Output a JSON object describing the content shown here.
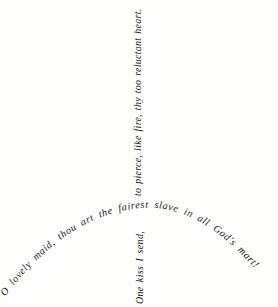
{
  "composition": {
    "title": "Calligraphic verse arrangement",
    "background_color": "#fdfdfc",
    "ink_color": "#1c1a18",
    "width": 278,
    "height": 307
  },
  "verse": {
    "arc_line": "O lovely maid, thou art the fairest slave in all God's mart!",
    "vertical_up_line": "to pierce, like fire, thy too reluctant heart.",
    "vertical_down_line": "One kiss I send,",
    "full_text": "O lovely maid, thou art the fairest slave in all God's mart! One kiss I send, to pierce, like fire, thy too reluctant heart."
  }
}
